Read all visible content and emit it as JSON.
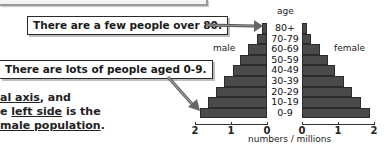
{
  "callouts": {
    "over80": "There are a few people over 80.",
    "aged09": "There are lots of people aged 0-9."
  },
  "body_text": {
    "line1_underlined": "al axis",
    "line1_rest": ", and",
    "line2_prefix": "e ",
    "line2_underlined": "left side",
    "line2_rest": " is the",
    "line3_underlined": "male population",
    "line3_rest": "."
  },
  "chart_labels": {
    "age": "age",
    "male": "male",
    "female": "female",
    "xlabel": "numbers / millions"
  },
  "chart_data": {
    "type": "bar",
    "subtype": "population-pyramid",
    "title": "",
    "categories": [
      "80+",
      "70-79",
      "60-69",
      "50-59",
      "40-49",
      "30-39",
      "20-29",
      "10-19",
      "0-9"
    ],
    "series": [
      {
        "name": "male",
        "values": [
          0.14,
          0.28,
          0.53,
          0.75,
          0.94,
          1.19,
          1.42,
          1.64,
          1.86
        ]
      },
      {
        "name": "female",
        "values": [
          0.14,
          0.25,
          0.5,
          0.72,
          0.92,
          1.17,
          1.39,
          1.64,
          1.89
        ]
      }
    ],
    "xlabel": "numbers / millions",
    "ylabel": "age",
    "xlim": [
      0,
      2
    ],
    "x_ticks_male": [
      "2",
      "1",
      "0"
    ],
    "x_ticks_female": [
      "0",
      "1",
      "2"
    ],
    "grid": false,
    "legend": "side labels: male (left), female (right)",
    "annotations": [
      "There are a few people over 80.",
      "There are lots of people aged 0-9."
    ]
  }
}
